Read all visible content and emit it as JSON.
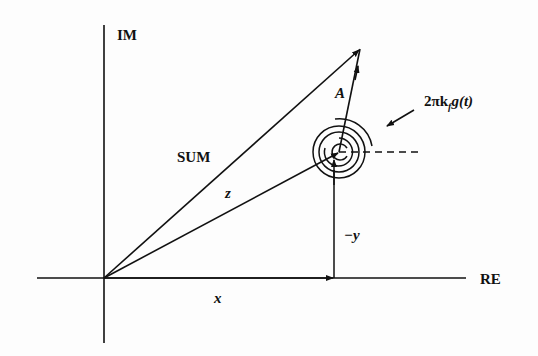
{
  "diagram": {
    "type": "phasor-diagram",
    "axes": {
      "vertical_label": "IM",
      "horizontal_label": "RE"
    },
    "vectors": [
      {
        "name": "SUM",
        "label": "SUM"
      },
      {
        "name": "z",
        "label": "z"
      },
      {
        "name": "A",
        "label": "A"
      },
      {
        "name": "x",
        "label": "x"
      },
      {
        "name": "-y",
        "label": "−y"
      }
    ],
    "rotation": {
      "label_main": "2πk",
      "label_sub": "f",
      "label_tail": "g(t)"
    }
  },
  "colors": {
    "ink": "#111111",
    "background": "#fdfdfd"
  }
}
